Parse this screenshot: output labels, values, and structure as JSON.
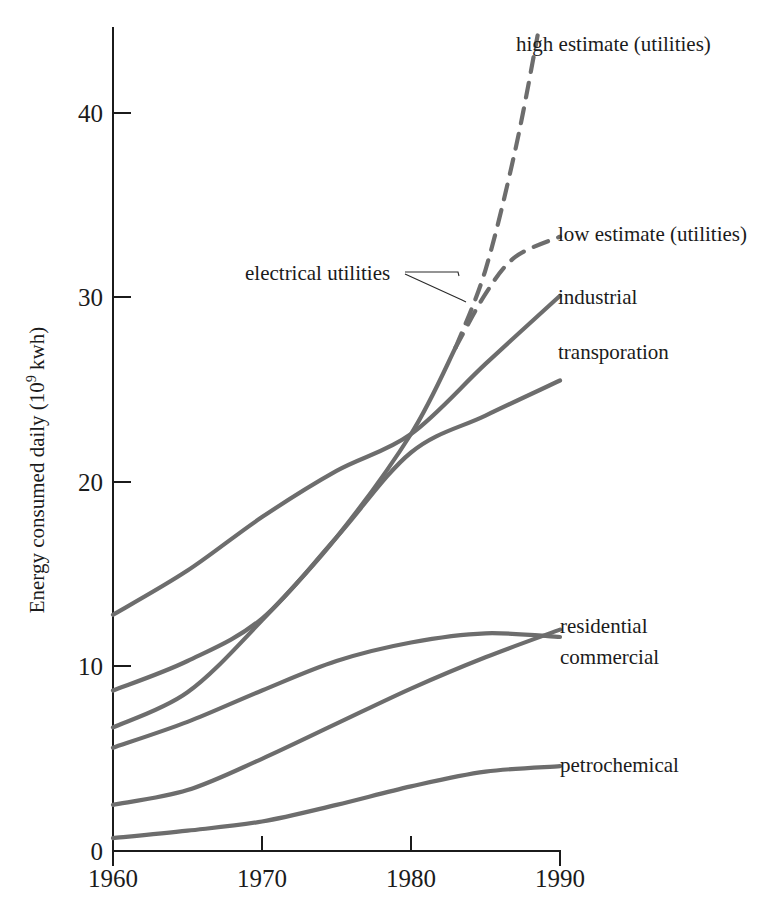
{
  "chart_data": {
    "type": "line",
    "title": "",
    "subtitle": "",
    "xlabel": "",
    "ylabel": "Energy consumed daily (10⁹ kwh)",
    "ylabel_parts": {
      "prefix": "Energy consumed daily (10",
      "exponent": "9",
      "suffix": " kwh)"
    },
    "x": [
      1960,
      1970,
      1980,
      1990
    ],
    "xlim": [
      1960,
      1990
    ],
    "ylim": [
      0,
      44
    ],
    "xticks": [
      "1960",
      "1970",
      "1980",
      "1990"
    ],
    "yticks": [
      "0",
      "10",
      "20",
      "30",
      "40"
    ],
    "ytick_values": [
      0,
      10,
      20,
      30,
      40
    ],
    "grid": false,
    "legend_position": "inline-right-labels",
    "line_color": "#6d6d6d",
    "axis_color": "#1b1b1b",
    "background_color": "#ffffff",
    "series": [
      {
        "name": "high estimate (utilities)",
        "label": "high estimate (utilities)",
        "style": "dashed",
        "x": [
          1960,
          1965,
          1970,
          1975,
          1980,
          1983,
          1985,
          1987,
          1988.5
        ],
        "values": [
          6.7,
          8.6,
          12.5,
          17.0,
          22.6,
          27.3,
          31.5,
          38.0,
          44.2
        ],
        "dash_start_year": 1983
      },
      {
        "name": "low estimate (utilities)",
        "label": "low estimate (utilities)",
        "style": "dashed",
        "x": [
          1983,
          1985,
          1987,
          1990
        ],
        "values": [
          27.3,
          30.2,
          32.2,
          33.3
        ],
        "dash_start_year": 1983
      },
      {
        "name": "industrial",
        "label": "industrial",
        "style": "solid",
        "x": [
          1960,
          1965,
          1970,
          1975,
          1980,
          1985,
          1990
        ],
        "values": [
          12.8,
          15.2,
          18.1,
          20.6,
          22.6,
          26.4,
          30.1
        ]
      },
      {
        "name": "transporation",
        "label": "transporation",
        "style": "solid",
        "x": [
          1960,
          1965,
          1970,
          1975,
          1980,
          1985,
          1990
        ],
        "values": [
          8.7,
          10.3,
          12.6,
          17.0,
          21.6,
          23.6,
          25.5
        ]
      },
      {
        "name": "residential",
        "label": "residential",
        "style": "solid",
        "x": [
          1960,
          1965,
          1970,
          1975,
          1980,
          1985,
          1990
        ],
        "values": [
          5.6,
          7.0,
          8.7,
          10.3,
          11.3,
          11.8,
          11.6
        ]
      },
      {
        "name": "commercial",
        "label": "commercial",
        "style": "solid",
        "x": [
          1960,
          1965,
          1970,
          1975,
          1980,
          1985,
          1990
        ],
        "values": [
          2.5,
          3.3,
          5.0,
          6.9,
          8.8,
          10.5,
          12.0
        ]
      },
      {
        "name": "petrochemical",
        "label": "petrochemical",
        "style": "solid",
        "x": [
          1960,
          1965,
          1970,
          1975,
          1980,
          1985,
          1990
        ],
        "values": [
          0.7,
          1.1,
          1.6,
          2.5,
          3.5,
          4.3,
          4.6
        ]
      }
    ],
    "annotations": [
      {
        "text": "electrical utilities",
        "target": "utilities curves (solid and dashed branches)"
      }
    ]
  },
  "labels": {
    "high_estimate": "high estimate (utilities)",
    "low_estimate": "low estimate (utilities)",
    "industrial": "industrial",
    "transporation": "transporation",
    "residential": "residential",
    "commercial": "commercial",
    "petrochemical": "petrochemical",
    "electrical_utilities": "electrical utilities"
  },
  "axis": {
    "y_title_prefix": "Energy consumed daily (10",
    "y_title_exponent": "9",
    "y_title_suffix": " kwh)",
    "y_tick_0": "0",
    "y_tick_10": "10",
    "y_tick_20": "20",
    "y_tick_30": "30",
    "y_tick_40": "40",
    "x_tick_1960": "1960",
    "x_tick_1970": "1970",
    "x_tick_1980": "1980",
    "x_tick_1990": "1990"
  }
}
